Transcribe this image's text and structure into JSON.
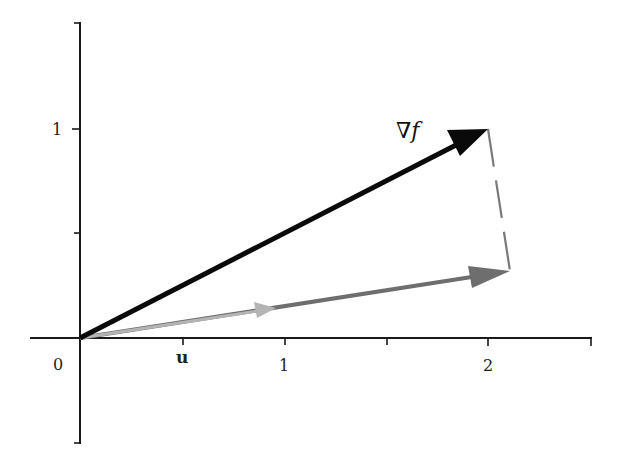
{
  "figure": {
    "axes": {
      "x_tick_labels": [
        "0",
        "1",
        "2"
      ],
      "y_tick_labels": [
        "1"
      ],
      "origin_label": "0"
    },
    "labels": {
      "gradient": "∇f",
      "unit_vector": "u"
    },
    "colors": {
      "axis": "#1a1a1a",
      "gradient_vector": "#0a0a0a",
      "projection_vector": "#6e6e6e",
      "unit_vector": "#b4b4b4",
      "dashed_line": "#7a7a7a"
    }
  },
  "diagram_data": {
    "type": "vector-diagram",
    "vectors": [
      {
        "name": "gradient",
        "label": "∇f",
        "from": [
          0,
          0
        ],
        "to": [
          2,
          1
        ],
        "color": "#0a0a0a"
      },
      {
        "name": "projection",
        "label": "",
        "from": [
          0,
          0
        ],
        "to": [
          2.1,
          0.32
        ],
        "color": "#6e6e6e"
      },
      {
        "name": "unit",
        "label": "u",
        "from": [
          0,
          0
        ],
        "to": [
          0.93,
          0.14
        ],
        "color": "#b4b4b4"
      }
    ],
    "dashed_segment": {
      "from": [
        2,
        1
      ],
      "to": [
        2.1,
        0.32
      ]
    },
    "x_range": [
      -0.25,
      2.5
    ],
    "y_range": [
      -0.5,
      1.5
    ],
    "x_ticks": [
      0.5,
      1,
      1.5,
      2,
      2.5
    ],
    "y_ticks": [
      0.5,
      1,
      1.5,
      -0.5
    ]
  }
}
